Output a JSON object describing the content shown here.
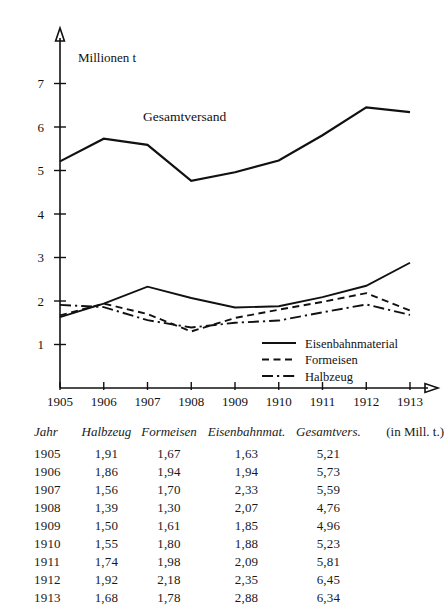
{
  "figure": {
    "axis_unit_label": "Millionen t",
    "inline_annotation": "Gesamtversand",
    "table_note": "(in Mill. t.)"
  },
  "chart_data": {
    "type": "line",
    "title": "",
    "xlabel": "",
    "ylabel": "Millionen t",
    "x": [
      1905,
      1906,
      1907,
      1908,
      1909,
      1910,
      1911,
      1912,
      1913
    ],
    "xtick_labels": [
      "1905",
      "1906",
      "1907",
      "1908",
      "1909",
      "1910",
      "1911",
      "1912",
      "1913"
    ],
    "ytick_labels": [
      "1",
      "2",
      "3",
      "4",
      "5",
      "6",
      "7"
    ],
    "yticks": [
      1,
      2,
      3,
      4,
      5,
      6,
      7
    ],
    "ylim": [
      0,
      7.6
    ],
    "grid": false,
    "legend_position": "lower-right",
    "annotations": [
      {
        "text": "Gesamtversand",
        "x": 1907.85,
        "y": 6.15
      }
    ],
    "series": [
      {
        "name": "Gesamtversand",
        "style": "solid-thick",
        "in_legend": false,
        "values": [
          5.21,
          5.73,
          5.59,
          4.76,
          4.96,
          5.23,
          5.81,
          6.45,
          6.34
        ]
      },
      {
        "name": "Eisenbahnmaterial",
        "style": "solid",
        "in_legend": true,
        "values": [
          1.63,
          1.94,
          2.33,
          2.07,
          1.85,
          1.88,
          2.09,
          2.35,
          2.88
        ]
      },
      {
        "name": "Formeisen",
        "style": "dashed",
        "in_legend": true,
        "values": [
          1.67,
          1.94,
          1.7,
          1.3,
          1.61,
          1.8,
          1.98,
          2.18,
          1.78
        ]
      },
      {
        "name": "Halbzeug",
        "style": "dashdot",
        "in_legend": true,
        "values": [
          1.91,
          1.86,
          1.56,
          1.39,
          1.5,
          1.55,
          1.74,
          1.92,
          1.68
        ]
      }
    ]
  },
  "legend": {
    "entries": [
      {
        "label": "Eisenbahnmaterial",
        "style": "solid"
      },
      {
        "label": "Formeisen",
        "style": "dashed"
      },
      {
        "label": "Halbzeug",
        "style": "dashdot"
      }
    ]
  },
  "table": {
    "headers": [
      "Jahr",
      "Halbzeug",
      "Formeisen",
      "Eisenbahnmat.",
      "Gesamtvers.",
      "(in Mill. t.)"
    ],
    "rows": [
      [
        "1905",
        "1,91",
        "1,67",
        "1,63",
        "5,21"
      ],
      [
        "1906",
        "1,86",
        "1,94",
        "1,94",
        "5,73"
      ],
      [
        "1907",
        "1,56",
        "1,70",
        "2,33",
        "5,59"
      ],
      [
        "1908",
        "1,39",
        "1,30",
        "2,07",
        "4,76"
      ],
      [
        "1909",
        "1,50",
        "1,61",
        "1,85",
        "4,96"
      ],
      [
        "1910",
        "1,55",
        "1,80",
        "1,88",
        "5,23"
      ],
      [
        "1911",
        "1,74",
        "1,98",
        "2,09",
        "5,81"
      ],
      [
        "1912",
        "1,92",
        "2,18",
        "2,35",
        "6,45"
      ],
      [
        "1913",
        "1,68",
        "1,78",
        "2,88",
        "6,34"
      ]
    ]
  }
}
